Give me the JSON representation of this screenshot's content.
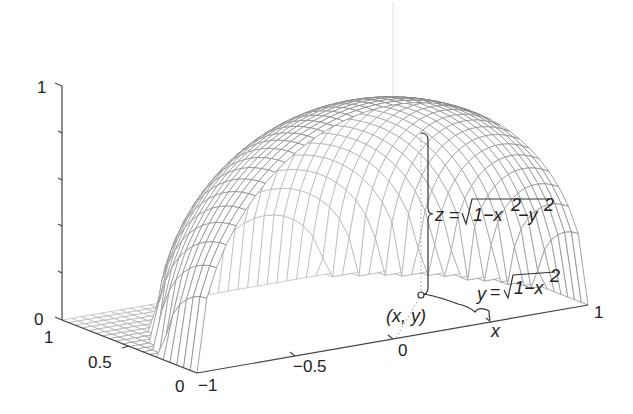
{
  "chart_data": {
    "type": "surface-wireframe",
    "title": "",
    "surface": "z = sqrt(1 - x^2 - y^2), restricted to 0 <= y <= 1 (zero outside unit disc)",
    "x_range": [
      -1,
      1
    ],
    "y_range": [
      0,
      1
    ],
    "z_range": [
      0,
      1
    ],
    "x_ticks": [
      "-1",
      "-0.5",
      "0",
      "1"
    ],
    "x_tick_values": [
      -1,
      -0.5,
      0,
      1
    ],
    "y_ticks": [
      "0",
      "0.5",
      "1"
    ],
    "y_tick_values": [
      0,
      0.5,
      1
    ],
    "z_ticks": [
      "0",
      "1"
    ],
    "z_tick_values": [
      0,
      1
    ],
    "z_minor_ticks": [
      0.2,
      0.4,
      0.6,
      0.8
    ],
    "mesh": {
      "nx": 41,
      "ny": 21
    },
    "grid": false,
    "legend": null,
    "annotations": [
      {
        "text": "z = √(1−x²−y²)",
        "kind": "height-brace"
      },
      {
        "text": "y = √(1−x²)",
        "kind": "base-brace"
      },
      {
        "text": "(x, y)",
        "kind": "point-label"
      },
      {
        "text": "x",
        "kind": "axis-point-label"
      }
    ],
    "point": {
      "x": 0.5,
      "y": 0.5
    }
  },
  "labels": {
    "z_top": "1",
    "z_bottom": "0",
    "y_one": "1",
    "y_half": "0.5",
    "y_zero": "0",
    "x_neg1": "−1",
    "x_neghalf": "−0.5",
    "x_zero": "0",
    "x_one": "1",
    "point_label": "(x, y)",
    "x_marker": "x",
    "z_eq_lhs": "z",
    "z_eq_eq": "=",
    "z_eq_rad": "1−x",
    "z_eq_sup1": "2",
    "z_eq_mid": "−y",
    "z_eq_sup2": "2",
    "y_eq_lhs": "y",
    "y_eq_eq": "=",
    "y_eq_rad": "1−x",
    "y_eq_sup": "2"
  },
  "colors": {
    "mesh_front": "#7a7a7a",
    "mesh_back": "#b8b8b8",
    "axis": "#444444",
    "text": "#222222",
    "background": "#ffffff"
  }
}
